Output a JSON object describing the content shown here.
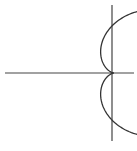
{
  "diagram": {
    "type": "polar-curve",
    "curve": "cardioid",
    "equation": "r = a(1 - cos θ)",
    "orientation": "cusp at origin, body extending to negative x",
    "axes": [
      "horizontal-axis",
      "vertical-axis"
    ],
    "colors": {
      "background": "#ffffff",
      "stroke": "#333333"
    }
  }
}
